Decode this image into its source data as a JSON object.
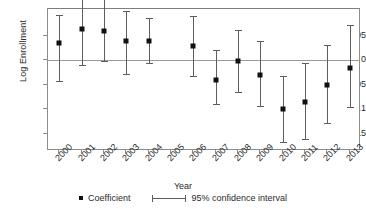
{
  "chart_data": {
    "type": "scatter",
    "title": "",
    "xlabel": "Year",
    "ylabel": "Log Enrollment",
    "categories": [
      "2000",
      "2001",
      "2002",
      "2003",
      "2004",
      "2005",
      "2006",
      "2007",
      "2008",
      "2009",
      "2010",
      "2011",
      "2012",
      "2013"
    ],
    "ytick_labels": [
      ".05",
      "0",
      "-.05",
      "-.1",
      "-.15"
    ],
    "ytick_values": [
      0.05,
      0,
      -0.05,
      -0.1,
      -0.15
    ],
    "ylim": [
      -0.185,
      0.105
    ],
    "grid": false,
    "legend_position": "below",
    "reference_line": 0,
    "omitted_category": "2005",
    "series": [
      {
        "name": "Coefficient",
        "values": [
          0.035,
          0.065,
          0.06,
          0.04,
          0.04,
          null,
          0.03,
          -0.04,
          -0.002,
          -0.03,
          -0.1,
          -0.085,
          -0.05,
          -0.015
        ]
      },
      {
        "name": "95% confidence interval lower",
        "values": [
          -0.043,
          -0.01,
          -0.001,
          -0.028,
          -0.005,
          null,
          -0.032,
          -0.09,
          -0.064,
          -0.094,
          -0.167,
          -0.16,
          -0.128,
          -0.096
        ]
      },
      {
        "name": "95% confidence interval upper",
        "values": [
          0.093,
          0.141,
          0.125,
          0.1,
          0.086,
          null,
          0.09,
          0.021,
          0.062,
          0.04,
          -0.032,
          -0.006,
          0.032,
          0.072
        ]
      }
    ],
    "legend": [
      {
        "label": "Coefficient",
        "marker": "square-dot"
      },
      {
        "label": "95% confidence interval",
        "marker": "capped-line"
      }
    ]
  },
  "colors": {
    "marker": "#111111",
    "interval": "#5d5d5d",
    "axis": "#8d8d8d",
    "zero_line": "#9a9a9a",
    "text": "#2b2b2b",
    "background": "#ffffff"
  },
  "top_artifact": "",
  "legend_labels": {
    "coefficient": "Coefficient",
    "confidence": "95% confidence interval"
  },
  "axes": {
    "x_title": "Year",
    "y_title": "Log Enrollment"
  }
}
